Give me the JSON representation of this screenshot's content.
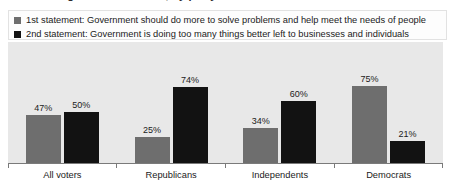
{
  "title": {
    "text": "Views of government's role, by party",
    "visible": "clipped"
  },
  "legend": {
    "position": "top",
    "entries": [
      {
        "swatch_name": "legend-swatch-series-1",
        "color": "#6e6e6e",
        "label": "1st statement: Government should do more to solve problems and help meet the needs of people"
      },
      {
        "swatch_name": "legend-swatch-series-2",
        "color": "#121212",
        "label": "2nd statement: Government is doing too many things better left to businesses and individuals"
      }
    ]
  },
  "chart_data": {
    "type": "bar",
    "title": "Views of government's role, by party",
    "xlabel": "",
    "ylabel": "",
    "ylim": [
      0,
      100
    ],
    "grid": false,
    "legend_position": "top",
    "categories": [
      "All voters",
      "Republicans",
      "Independents",
      "Democrats"
    ],
    "series": [
      {
        "name": "1st statement: Government should do more to solve problems and help meet the needs of people",
        "color": "#6e6e6e",
        "values": [
          47,
          25,
          34,
          75
        ],
        "labels": [
          "47%",
          "25%",
          "34%",
          "75%"
        ]
      },
      {
        "name": "2nd statement: Government is doing too many things better left to businesses and individuals",
        "color": "#121212",
        "values": [
          50,
          74,
          60,
          21
        ],
        "labels": [
          "50%",
          "74%",
          "60%",
          "21%"
        ]
      }
    ]
  },
  "colors": {
    "plot_background": "#e8e8e8",
    "page_background": "#ffffff",
    "axis": "#7a7a7a",
    "text": "#1b1b1b",
    "series_1": "#6e6e6e",
    "series_2": "#121212"
  }
}
